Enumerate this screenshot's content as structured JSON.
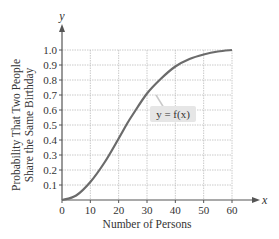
{
  "chart_data": {
    "type": "line",
    "title": "",
    "xlabel": "Number of Persons",
    "ylabel": "Probability That Two People Share the Same Birthday",
    "ylabel_lines": [
      "Probability That Two People",
      "Share the Same Birthday"
    ],
    "x_axis_var": "x",
    "y_axis_var": "y",
    "xlim": [
      0,
      60
    ],
    "ylim": [
      0,
      1.0
    ],
    "x_ticks": [
      0,
      10,
      20,
      30,
      40,
      50,
      60
    ],
    "x_tick_labels": [
      "0",
      "10",
      "20",
      "30",
      "40",
      "50",
      "60"
    ],
    "y_ticks": [
      0.1,
      0.2,
      0.3,
      0.4,
      0.5,
      0.6,
      0.7,
      0.8,
      0.9,
      1.0
    ],
    "y_tick_labels": [
      "0.1",
      "0.2",
      "0.3",
      "0.4",
      "0.5",
      "0.6",
      "0.7",
      "0.8",
      "0.9",
      "1.0"
    ],
    "grid": true,
    "legend": null,
    "annotation": "y = f(x)",
    "series": [
      {
        "name": "y = f(x)",
        "x": [
          0,
          5,
          10,
          15,
          20,
          23,
          25,
          30,
          35,
          40,
          45,
          50,
          55,
          60
        ],
        "y": [
          0,
          0.03,
          0.12,
          0.25,
          0.41,
          0.51,
          0.57,
          0.71,
          0.81,
          0.89,
          0.94,
          0.97,
          0.99,
          1.0
        ]
      }
    ],
    "colors": {
      "curve": "#6b6b6b",
      "grid": "#bdbdbd",
      "axis": "#555555",
      "annotation_bg": "#e6e6e6"
    }
  }
}
